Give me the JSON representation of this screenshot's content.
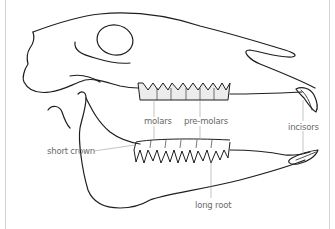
{
  "diagram": {
    "labels": {
      "molars": "molars",
      "pre_molars": "pre-molars",
      "incisors": "incisors",
      "short_crown": "short crown",
      "long_root": "long root"
    },
    "colors": {
      "outline": "#1e1e1e",
      "label_text": "#6a6a6a",
      "leader_line": "#9a9a9a",
      "tooth_fill": "#ececec",
      "frame": "#d4d4d4"
    }
  }
}
